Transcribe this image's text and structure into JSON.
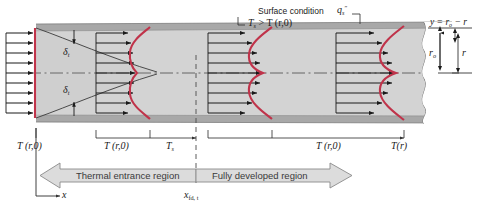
{
  "figure": {
    "type": "engineering-schematic"
  },
  "annotations": {
    "surface_condition_line1": "Surface condition",
    "surface_condition_Ts": "T",
    "surface_condition_Ts_sub": "s",
    "surface_condition_rest": "> T (r,0)",
    "heat_flux_q": "q",
    "heat_flux_sub": "s",
    "heat_flux_sup": "″",
    "radius_relation": "y = r",
    "radius_relation_sub": "o",
    "radius_relation_tail": "− r",
    "r_outer": "r",
    "r_outer_sub": "o",
    "r_local": "r",
    "delta_upper": "δ",
    "delta_upper_sub": "t",
    "delta_lower": "δ",
    "delta_lower_sub": "t"
  },
  "profile_labels": [
    {
      "id": "inlet",
      "text": "T (r,0)"
    },
    {
      "id": "entrance-profile",
      "text": "T (r,0)"
    },
    {
      "id": "surface-temp",
      "text": "T",
      "sub": "s"
    },
    {
      "id": "developed-profile",
      "text": "T (r,0)"
    },
    {
      "id": "developed-temp",
      "text": "T(r)"
    }
  ],
  "regions": {
    "entrance_label": "Thermal entrance region",
    "developed_label": "Fully developed region",
    "transition_x": "x",
    "transition_x_sub": "fd, t"
  },
  "axis": {
    "x_label": "x"
  },
  "colors": {
    "profile_curve": "#c0334a",
    "tube_wall": "#9b9b9b",
    "fluid_fill": "#d4d4d4",
    "band_fill": "#d9d9d9",
    "arrow_stroke": "#1a1a1a",
    "centerline": "#4a4a4a"
  }
}
